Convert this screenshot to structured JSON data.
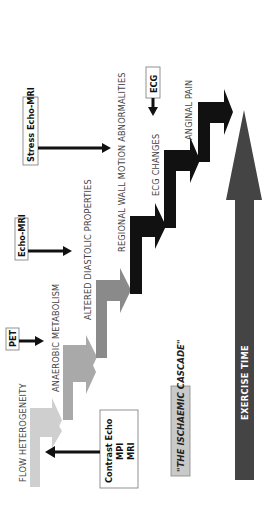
{
  "title": "\"THE ISCHAEMIC CASCADE\"",
  "axis": {
    "label": "EXERCISE TIME",
    "color": "#444444"
  },
  "steps": [
    {
      "label": "FLOW HETEROGENEITY",
      "color": "#cfcfcf"
    },
    {
      "label": "ANAEROBIC METABOLISM",
      "color": "#a9a9a9"
    },
    {
      "label": "ALTERED DIASTOLIC PROPERTIES",
      "color": "#8a8a8a"
    },
    {
      "label": "REGIONAL WALL MOTION ABNORMALITIES",
      "color": "#111111"
    },
    {
      "label": "ECG CHANGES",
      "color": "#111111"
    },
    {
      "label": "ANGINAL PAIN",
      "color": "#111111"
    }
  ],
  "modalities": {
    "contrast": {
      "line1": "Contrast Echo",
      "line2": "MPI",
      "line3": "MRI"
    },
    "pet": {
      "label": "PET"
    },
    "echo_mri": {
      "label": "Echo-MRI"
    },
    "stress_echo_mri": {
      "label": "Stress Echo-MRI"
    },
    "ecg": {
      "label": "ECG"
    }
  },
  "colors": {
    "title_box_fill": "#c9c9c9",
    "arrow": "#111111"
  }
}
